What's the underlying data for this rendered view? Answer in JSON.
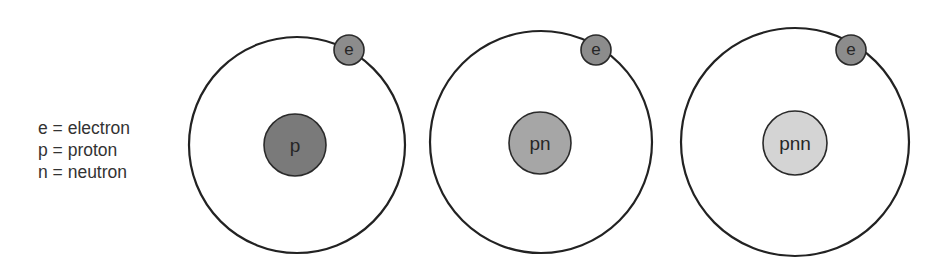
{
  "legend": {
    "items": [
      {
        "label": "e = electron"
      },
      {
        "label": "p = proton"
      },
      {
        "label": "n = neutron"
      }
    ]
  },
  "atoms": [
    {
      "name": "hydrogen-protium",
      "orbit": {
        "cx": 297,
        "cy": 145,
        "r": 108
      },
      "nucleus": {
        "label": "p",
        "cx": 295,
        "cy": 145,
        "r": 31,
        "color": "#7a7a7a"
      },
      "electron": {
        "label": "e",
        "cx": 349,
        "cy": 50,
        "r": 15,
        "color": "#8c8c8c"
      }
    },
    {
      "name": "hydrogen-deuterium",
      "orbit": {
        "cx": 541,
        "cy": 142,
        "r": 111
      },
      "nucleus": {
        "label": "pn",
        "cx": 540,
        "cy": 143,
        "r": 31,
        "color": "#a6a6a6"
      },
      "electron": {
        "label": "e",
        "cx": 596,
        "cy": 50,
        "r": 15,
        "color": "#8c8c8c"
      }
    },
    {
      "name": "hydrogen-tritium",
      "orbit": {
        "cx": 795,
        "cy": 142,
        "r": 114
      },
      "nucleus": {
        "label": "pnn",
        "cx": 795,
        "cy": 143,
        "r": 32,
        "color": "#d4d4d4"
      },
      "electron": {
        "label": "e",
        "cx": 851,
        "cy": 50,
        "r": 15,
        "color": "#8c8c8c"
      }
    }
  ]
}
